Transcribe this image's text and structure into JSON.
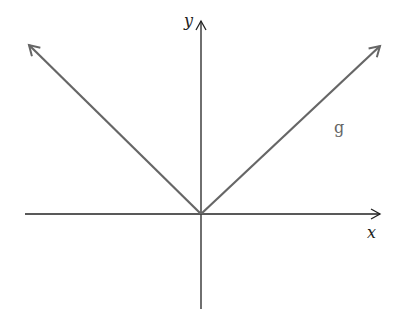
{
  "diagram": {
    "type": "function-graph",
    "function_label": "g",
    "x_axis_label": "x",
    "y_axis_label": "y",
    "colors": {
      "axes": "#222222",
      "graph": "#666666",
      "background": "#ffffff"
    }
  }
}
